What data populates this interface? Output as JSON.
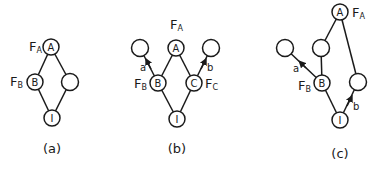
{
  "diagrams": [
    {
      "caption": "(a)",
      "nodes": {
        "A": {
          "label": "A",
          "tag": "F",
          "tag_sub": "A"
        },
        "B": {
          "label": "B",
          "tag": "F",
          "tag_sub": "B"
        },
        "R": {
          "label": ""
        },
        "I": {
          "label": "I"
        }
      }
    },
    {
      "caption": "(b)",
      "nodes": {
        "A": {
          "label": "A",
          "tag": "F",
          "tag_sub": "A"
        },
        "B": {
          "label": "B",
          "tag": "F",
          "tag_sub": "B"
        },
        "C": {
          "label": "C",
          "tag": "F",
          "tag_sub": "C"
        },
        "L": {
          "label": ""
        },
        "R": {
          "label": ""
        },
        "I": {
          "label": "I"
        }
      },
      "edge_labels": {
        "a": "a",
        "b": "b"
      }
    },
    {
      "caption": "(c)",
      "nodes": {
        "A": {
          "label": "A",
          "tag": "F",
          "tag_sub": "A"
        },
        "M": {
          "label": ""
        },
        "L": {
          "label": ""
        },
        "B": {
          "label": "B",
          "tag": "F",
          "tag_sub": "B"
        },
        "R": {
          "label": ""
        },
        "I": {
          "label": "I"
        }
      },
      "edge_labels": {
        "a": "a",
        "b": "b"
      }
    }
  ],
  "colors": {
    "ink": "#1a1a1a",
    "background": "#ffffff"
  }
}
